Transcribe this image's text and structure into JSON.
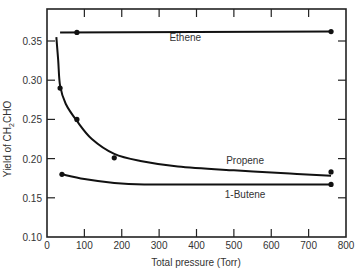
{
  "chart_data": {
    "type": "line",
    "title": "",
    "xlabel": "Total pressure (Torr)",
    "ylabel": "Yield of CH2CHO",
    "ylabel_parts": {
      "main": "Yield of CH",
      "sub": "2",
      "tail": "CHO"
    },
    "xlim": [
      0,
      800
    ],
    "ylim": [
      0.1,
      0.38
    ],
    "xticks": [
      0,
      100,
      200,
      300,
      400,
      500,
      600,
      700,
      800
    ],
    "yticks": [
      0.1,
      0.15,
      0.2,
      0.25,
      0.3,
      0.35
    ],
    "ytick_labels": [
      "0.10",
      "0.15",
      "0.20",
      "0.25",
      "0.30",
      "0.35"
    ],
    "grid": false,
    "legend": "inline labels",
    "series": [
      {
        "name": "Ethene",
        "points": [
          [
            80,
            0.361
          ],
          [
            760,
            0.362
          ]
        ],
        "curve": [
          [
            35,
            0.361
          ],
          [
            760,
            0.362
          ]
        ],
        "label_pos": [
          370,
          0.355
        ]
      },
      {
        "name": "Propene",
        "points": [
          [
            35,
            0.29
          ],
          [
            80,
            0.25
          ],
          [
            180,
            0.201
          ],
          [
            760,
            0.183
          ]
        ],
        "curve": [
          [
            25,
            0.355
          ],
          [
            30,
            0.325
          ],
          [
            35,
            0.293
          ],
          [
            50,
            0.27
          ],
          [
            80,
            0.248
          ],
          [
            120,
            0.225
          ],
          [
            180,
            0.206
          ],
          [
            250,
            0.197
          ],
          [
            350,
            0.19
          ],
          [
            500,
            0.185
          ],
          [
            650,
            0.181
          ],
          [
            760,
            0.178
          ]
        ],
        "label_pos": [
          530,
          0.198
        ]
      },
      {
        "name": "1-Butene",
        "points": [
          [
            40,
            0.18
          ],
          [
            760,
            0.167
          ]
        ],
        "curve": [
          [
            40,
            0.18
          ],
          [
            100,
            0.174
          ],
          [
            180,
            0.169
          ],
          [
            260,
            0.167
          ],
          [
            400,
            0.167
          ],
          [
            760,
            0.167
          ]
        ],
        "label_pos": [
          530,
          0.155
        ]
      }
    ]
  }
}
